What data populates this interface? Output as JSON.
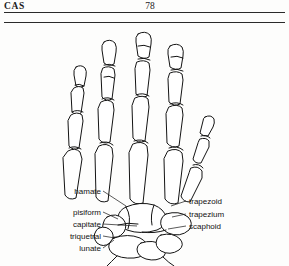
{
  "running_head": {
    "left_text": "CAS",
    "page_number": "78"
  },
  "figure": {
    "labels_left": [
      {
        "id": "hamate",
        "text": "hamate"
      },
      {
        "id": "pisiform",
        "text": "pisiform"
      },
      {
        "id": "capitate",
        "text": "capitate"
      },
      {
        "id": "triquetral",
        "text": "triquetral"
      },
      {
        "id": "lunate",
        "text": "lunate"
      }
    ],
    "labels_right": [
      {
        "id": "trapezoid",
        "text": "trapezoid"
      },
      {
        "id": "trapezium",
        "text": "trapezium"
      },
      {
        "id": "scaphoid",
        "text": "scaphoid"
      }
    ]
  },
  "colors": {
    "ink": "#141414",
    "rule": "#2a2a2a",
    "paper": "#fdfdfc"
  }
}
